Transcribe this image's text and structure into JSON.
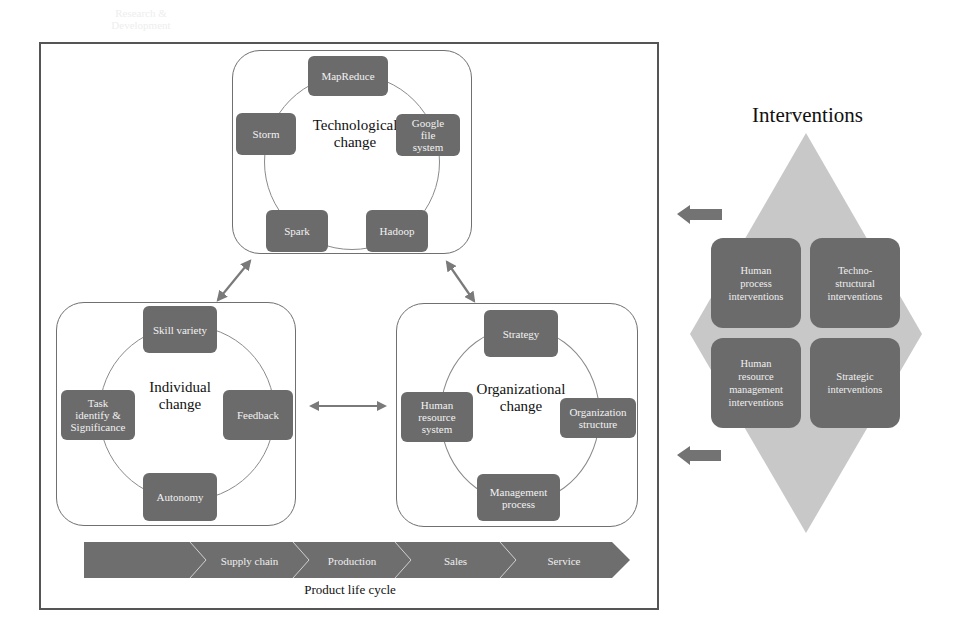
{
  "diagram": {
    "technological": {
      "title_line1": "Technological",
      "title_line2": "change",
      "nodes": [
        "MapReduce",
        "Google file system",
        "Hadoop",
        "Spark",
        "Storm"
      ],
      "google_lines": [
        "Google",
        "file",
        "system"
      ]
    },
    "individual": {
      "title_line1": "Individual",
      "title_line2": "change",
      "nodes": [
        "Skill variety",
        "Feedback",
        "Autonomy",
        "Task identify & Significance"
      ],
      "task_lines": [
        "Task",
        "identify &",
        "Significance"
      ]
    },
    "organizational": {
      "title_line1": "Organizational",
      "title_line2": "change",
      "nodes": [
        "Strategy",
        "Organization structure",
        "Management process",
        "Human resource system"
      ],
      "org_struct_lines": [
        "Organization",
        "structure"
      ],
      "mgmt_lines": [
        "Management",
        "process"
      ],
      "hr_lines": [
        "Human",
        "resource",
        "system"
      ]
    },
    "product_life_cycle": {
      "caption": "Product life cycle",
      "steps": [
        {
          "label": "Research & Development",
          "lines": [
            "Research &",
            "Development"
          ]
        },
        {
          "label": "Supply chain"
        },
        {
          "label": "Production"
        },
        {
          "label": "Sales"
        },
        {
          "label": "Service"
        }
      ]
    },
    "interventions": {
      "title": "Interventions",
      "boxes": [
        {
          "label": "Human process interventions",
          "lines": [
            "Human",
            "process",
            "interventions"
          ]
        },
        {
          "label": "Techno-structural interventions",
          "lines": [
            "Techno-",
            "structural",
            "interventions"
          ]
        },
        {
          "label": "Human resource management interventions",
          "lines": [
            "Human",
            "resource",
            "management",
            "interventions"
          ]
        },
        {
          "label": "Strategic interventions",
          "lines": [
            "Strategic",
            "interventions"
          ]
        }
      ]
    },
    "colors": {
      "node_fill": "#6b6b6b",
      "diamond_fill": "#c8c8c8",
      "arrow": "#7a7a7a",
      "frame": "#555555"
    }
  }
}
